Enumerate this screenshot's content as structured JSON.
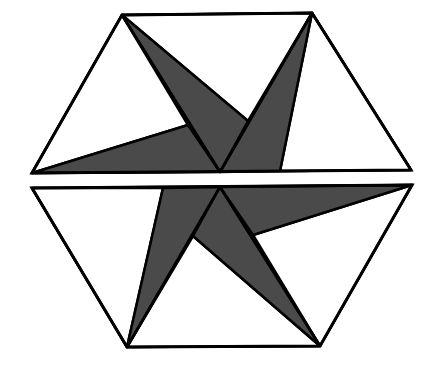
{
  "diagram": {
    "title": "Hexagon dissection pinwheel",
    "colors": {
      "background": "#ffffff",
      "fill_light": "#ffffff",
      "fill_dark": "#4a4a4a",
      "stroke": "#000000"
    },
    "upper_half": {
      "outline": [
        [
          122,
          15
        ],
        [
          312,
          13
        ],
        [
          411,
          170
        ],
        [
          32,
          173
        ]
      ],
      "center": [
        220,
        172
      ],
      "triangles_light": [
        [
          [
            122,
            15
          ],
          [
            32,
            173
          ],
          [
            188,
            125
          ]
        ],
        [
          [
            122,
            15
          ],
          [
            312,
            13
          ],
          [
            248,
            121
          ]
        ],
        [
          [
            312,
            13
          ],
          [
            411,
            170
          ],
          [
            280,
            171
          ]
        ]
      ],
      "triangles_dark": [
        [
          [
            32,
            173
          ],
          [
            188,
            125
          ],
          [
            220,
            172
          ]
        ],
        [
          [
            122,
            15
          ],
          [
            248,
            121
          ],
          [
            220,
            172
          ]
        ],
        [
          [
            312,
            13
          ],
          [
            280,
            171
          ],
          [
            220,
            172
          ]
        ]
      ],
      "lines": [
        [
          [
            122,
            15
          ],
          [
            220,
            172
          ]
        ],
        [
          [
            312,
            13
          ],
          [
            220,
            172
          ]
        ]
      ]
    },
    "lower_half": {
      "outline": [
        [
          32,
          188
        ],
        [
          412,
          185
        ],
        [
          320,
          346
        ],
        [
          127,
          347
        ]
      ],
      "center": [
        220,
        187
      ],
      "triangles_light": [
        [
          [
            32,
            188
          ],
          [
            163,
            188
          ],
          [
            127,
            347
          ]
        ],
        [
          [
            127,
            347
          ],
          [
            320,
            346
          ],
          [
            193,
            236
          ]
        ],
        [
          [
            412,
            185
          ],
          [
            320,
            346
          ],
          [
            253,
            235
          ]
        ]
      ],
      "triangles_dark": [
        [
          [
            163,
            188
          ],
          [
            220,
            187
          ],
          [
            127,
            347
          ]
        ],
        [
          [
            220,
            187
          ],
          [
            193,
            236
          ],
          [
            320,
            346
          ]
        ],
        [
          [
            220,
            187
          ],
          [
            412,
            185
          ],
          [
            253,
            235
          ]
        ]
      ],
      "lines": [
        [
          [
            220,
            187
          ],
          [
            127,
            347
          ]
        ],
        [
          [
            220,
            187
          ],
          [
            320,
            346
          ]
        ]
      ]
    }
  }
}
